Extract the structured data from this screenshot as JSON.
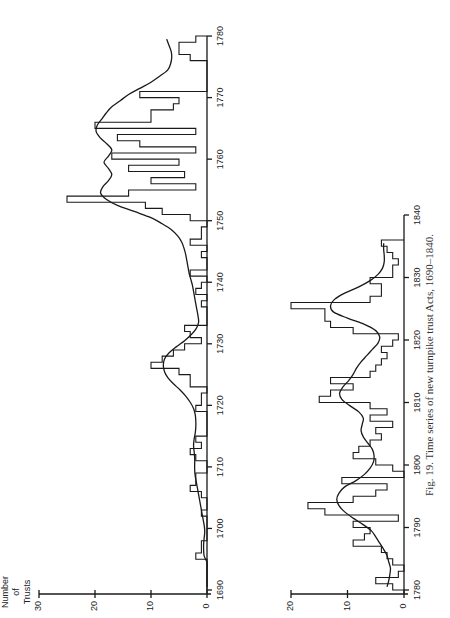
{
  "caption": "Fig. 19. Time series of new turnpike trust Acts, 1690–1840.",
  "ylabel_lines": [
    "Number",
    "of",
    "Trusts"
  ],
  "chart_data": [
    {
      "type": "line",
      "subtype": "step histogram with smoothed trend",
      "orientation": "rotated 90° counter-clockwise (years run up the page, counts extend leftward)",
      "title": "",
      "xlabel": "Year",
      "ylabel": "Number of Trusts",
      "xlim": [
        1690,
        1780
      ],
      "ylim": [
        0,
        30
      ],
      "xticks": [
        1690,
        1700,
        1710,
        1720,
        1730,
        1740,
        1750,
        1760,
        1770,
        1780
      ],
      "yticks": [
        0,
        10,
        20,
        30
      ],
      "grid": false,
      "x": [
        1690,
        1691,
        1692,
        1693,
        1694,
        1695,
        1696,
        1697,
        1698,
        1699,
        1700,
        1701,
        1702,
        1703,
        1704,
        1705,
        1706,
        1707,
        1708,
        1709,
        1710,
        1711,
        1712,
        1713,
        1714,
        1715,
        1716,
        1717,
        1718,
        1719,
        1720,
        1721,
        1722,
        1723,
        1724,
        1725,
        1726,
        1727,
        1728,
        1729,
        1730,
        1731,
        1732,
        1733,
        1734,
        1735,
        1736,
        1737,
        1738,
        1739,
        1740,
        1741,
        1742,
        1743,
        1744,
        1745,
        1746,
        1747,
        1748,
        1749,
        1750,
        1751,
        1752,
        1753,
        1754,
        1755,
        1756,
        1757,
        1758,
        1759,
        1760,
        1761,
        1762,
        1763,
        1764,
        1765,
        1766,
        1767,
        1768,
        1769,
        1770,
        1771,
        1772,
        1773,
        1774,
        1775,
        1776,
        1777,
        1778,
        1779
      ],
      "series": [
        {
          "name": "Annual new trusts",
          "values": [
            0,
            0,
            0,
            0,
            0,
            2,
            1,
            1,
            0,
            0,
            0,
            0,
            1,
            0,
            0,
            1,
            3,
            2,
            2,
            0,
            0,
            2,
            3,
            1,
            2,
            0,
            0,
            0,
            0,
            2,
            1,
            1,
            0,
            3,
            3,
            5,
            10,
            8,
            6,
            4,
            1,
            3,
            4,
            0,
            0,
            0,
            1,
            0,
            2,
            1,
            0,
            3,
            0,
            0,
            1,
            0,
            3,
            1,
            1,
            0,
            3,
            8,
            11,
            25,
            14,
            2,
            10,
            4,
            14,
            5,
            17,
            2,
            12,
            16,
            2,
            20,
            10,
            10,
            6,
            5,
            12,
            0,
            0,
            0,
            0,
            0,
            3,
            5,
            5,
            2
          ]
        },
        {
          "name": "Smoothed trend",
          "values": [
            0,
            0,
            0,
            0,
            0,
            0.5,
            0.6,
            0.6,
            0.5,
            0.4,
            0.5,
            0.7,
            0.9,
            1.1,
            1.3,
            1.5,
            1.7,
            1.9,
            2.1,
            2.2,
            2.2,
            2.2,
            2.3,
            2.4,
            2.3,
            2.1,
            2.0,
            2.0,
            2.1,
            2.4,
            3.0,
            3.8,
            4.8,
            6.0,
            7.0,
            7.6,
            7.8,
            7.6,
            6.8,
            5.5,
            4.0,
            2.8,
            1.9,
            1.5,
            1.6,
            1.8,
            2.0,
            2.2,
            2.4,
            2.6,
            2.9,
            3.2,
            3.4,
            3.6,
            3.8,
            4.1,
            4.5,
            5.2,
            6.3,
            8.0,
            10.0,
            13.0,
            16.0,
            18.0,
            19.0,
            18.6,
            17.6,
            17.0,
            17.6,
            18.4,
            17.6,
            17.0,
            17.9,
            19.1,
            19.8,
            19.6,
            18.8,
            18.0,
            17.0,
            15.5,
            14.0,
            12.0,
            10.0,
            8.4,
            7.0,
            6.5,
            6.3,
            6.4,
            6.8,
            7.2
          ]
        }
      ]
    },
    {
      "type": "line",
      "subtype": "step histogram with smoothed trend",
      "orientation": "rotated 90° counter-clockwise (years run up the page, counts extend leftward)",
      "title": "",
      "xlabel": "Year",
      "ylabel": "Number of Trusts",
      "xlim": [
        1780,
        1840
      ],
      "ylim": [
        0,
        20
      ],
      "xticks": [
        1780,
        1790,
        1800,
        1810,
        1820,
        1830,
        1840
      ],
      "yticks": [
        0,
        10,
        20
      ],
      "grid": false,
      "x": [
        1780,
        1781,
        1782,
        1783,
        1784,
        1785,
        1786,
        1787,
        1788,
        1789,
        1790,
        1791,
        1792,
        1793,
        1794,
        1795,
        1796,
        1797,
        1798,
        1799,
        1800,
        1801,
        1802,
        1803,
        1804,
        1805,
        1806,
        1807,
        1808,
        1809,
        1810,
        1811,
        1812,
        1813,
        1814,
        1815,
        1816,
        1817,
        1818,
        1819,
        1820,
        1821,
        1822,
        1823,
        1824,
        1825,
        1826,
        1827,
        1828,
        1829,
        1830,
        1831,
        1832,
        1833,
        1834,
        1835
      ],
      "series": [
        {
          "name": "Annual new trusts",
          "values": [
            2,
            5,
            1,
            0,
            2,
            3,
            4,
            9,
            7,
            6,
            9,
            1,
            14,
            17,
            9,
            5,
            3,
            11,
            0,
            2,
            5,
            9,
            8,
            6,
            4,
            5,
            2,
            6,
            3,
            6,
            15,
            13,
            9,
            13,
            6,
            5,
            4,
            3,
            4,
            2,
            1,
            9,
            13,
            14,
            14,
            20,
            6,
            4,
            4,
            6,
            2,
            2,
            1,
            2,
            3,
            4
          ]
        },
        {
          "name": "Smoothed trend",
          "values": [
            3,
            2.7,
            2.5,
            2.4,
            2.7,
            3.0,
            3.6,
            4.3,
            5.0,
            5.8,
            7.3,
            9.0,
            10.5,
            11.5,
            11.9,
            11.5,
            10.5,
            8.5,
            7.0,
            6.0,
            5.4,
            5.3,
            5.6,
            6.4,
            7.2,
            7.6,
            7.4,
            7.2,
            8.0,
            9.6,
            11.0,
            11.4,
            10.8,
            9.8,
            9.0,
            8.4,
            7.6,
            6.6,
            5.6,
            4.6,
            4.3,
            5.0,
            7.0,
            10.0,
            12.5,
            13.0,
            12.3,
            10.5,
            8.0,
            6.0,
            4.6,
            3.8,
            3.5,
            3.5,
            3.6,
            3.6
          ]
        }
      ]
    }
  ]
}
